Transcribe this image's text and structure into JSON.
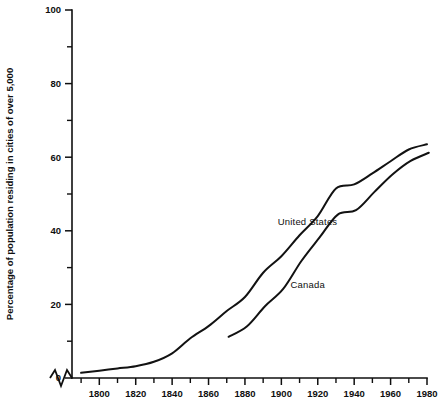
{
  "chart_data": {
    "type": "line",
    "title": "",
    "subtitle": "",
    "xlabel": "",
    "ylabel": "Percentage of population residing in cities of over 5,000",
    "xlim": [
      1785,
      1980
    ],
    "ylim": [
      0,
      100
    ],
    "grid": false,
    "legend_position": "inline-annotations",
    "x_axis_break": true,
    "x_axis_break_symbol": "zigzag",
    "x_ticks_major": [
      1800,
      1820,
      1840,
      1860,
      1880,
      1900,
      1920,
      1940,
      1960,
      1980
    ],
    "x_tick_labels": [
      "1800",
      "1820",
      "1840",
      "1860",
      "1880",
      "1900",
      "1920",
      "1940",
      "1960",
      "1980"
    ],
    "x_ticks_minor": [
      1790,
      1810,
      1830,
      1850,
      1870,
      1890,
      1910,
      1930,
      1950,
      1970
    ],
    "y_ticks_major": [
      0,
      20,
      40,
      60,
      80,
      100
    ],
    "y_tick_labels": [
      "0",
      "20",
      "40",
      "60",
      "80",
      "100"
    ],
    "y_ticks_minor": [
      10,
      30,
      50,
      70,
      90
    ],
    "series": [
      {
        "name": "United States",
        "label": "United States",
        "label_x": 1898,
        "label_y": 41.5,
        "color": "#121212",
        "x": [
          1790,
          1800,
          1810,
          1820,
          1830,
          1840,
          1850,
          1860,
          1870,
          1880,
          1890,
          1900,
          1910,
          1920,
          1930,
          1940,
          1950,
          1960,
          1970,
          1980
        ],
        "values": [
          1.4,
          2.0,
          2.6,
          3.2,
          4.4,
          6.7,
          10.8,
          14.1,
          18.2,
          22.0,
          28.6,
          33.1,
          38.8,
          44.0,
          51.5,
          52.6,
          55.6,
          58.9,
          62.1,
          63.5
        ]
      },
      {
        "name": "Canada",
        "label": "Canada",
        "label_x": 1905,
        "label_y": 24.5,
        "color": "#121212",
        "x": [
          1871,
          1881,
          1891,
          1901,
          1911,
          1921,
          1931,
          1941,
          1951,
          1961,
          1971,
          1981
        ],
        "values": [
          11.2,
          14.0,
          19.5,
          24.2,
          31.8,
          38.2,
          44.4,
          45.6,
          50.5,
          55.3,
          59.0,
          61.2
        ]
      }
    ]
  },
  "axis": {
    "y_title": "Percentage of population residing in cities of over 5,000"
  },
  "ticks": {
    "y": [
      "0",
      "20",
      "40",
      "60",
      "80",
      "100"
    ],
    "x": [
      "1800",
      "1820",
      "1840",
      "1860",
      "1880",
      "1900",
      "1920",
      "1940",
      "1960",
      "1980"
    ]
  },
  "annotations": {
    "united_states": "United States",
    "canada": "Canada"
  }
}
